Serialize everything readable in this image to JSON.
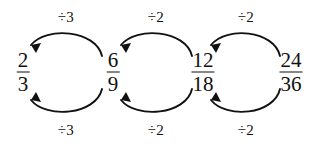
{
  "diagram": {
    "type": "fraction-reduction-chain",
    "ink_color": "#111111",
    "background_color": "#ffffff",
    "fractions": [
      {
        "id": "frac-1",
        "numerator": "2",
        "denominator": "3",
        "x": 23,
        "y": 72
      },
      {
        "id": "frac-2",
        "numerator": "6",
        "denominator": "9",
        "x": 113,
        "y": 72
      },
      {
        "id": "frac-3",
        "numerator": "12",
        "denominator": "18",
        "x": 203,
        "y": 72
      },
      {
        "id": "frac-4",
        "numerator": "24",
        "denominator": "36",
        "x": 291,
        "y": 72
      }
    ],
    "operations": [
      {
        "id": "op-top-1",
        "label": "÷3",
        "position": "top",
        "x": 66,
        "y": 17,
        "from": "frac-2",
        "to": "frac-1"
      },
      {
        "id": "op-top-2",
        "label": "÷2",
        "position": "top",
        "x": 156,
        "y": 17,
        "from": "frac-3",
        "to": "frac-2"
      },
      {
        "id": "op-top-3",
        "label": "÷2",
        "position": "top",
        "x": 246,
        "y": 17,
        "from": "frac-4",
        "to": "frac-3"
      },
      {
        "id": "op-bottom-1",
        "label": "÷3",
        "position": "bottom",
        "x": 66,
        "y": 130,
        "from": "frac-2",
        "to": "frac-1"
      },
      {
        "id": "op-bottom-2",
        "label": "÷2",
        "position": "bottom",
        "x": 156,
        "y": 130,
        "from": "frac-3",
        "to": "frac-2"
      },
      {
        "id": "op-bottom-3",
        "label": "÷2",
        "position": "bottom",
        "x": 246,
        "y": 130,
        "from": "frac-4",
        "to": "frac-3"
      }
    ],
    "arrows": [
      {
        "id": "arrow-top-1",
        "direction": "right-to-left",
        "curve": "arc-above"
      },
      {
        "id": "arrow-top-2",
        "direction": "right-to-left",
        "curve": "arc-above"
      },
      {
        "id": "arrow-top-3",
        "direction": "right-to-left",
        "curve": "arc-above"
      },
      {
        "id": "arrow-bottom-1",
        "direction": "right-to-left",
        "curve": "arc-below"
      },
      {
        "id": "arrow-bottom-2",
        "direction": "right-to-left",
        "curve": "arc-below"
      },
      {
        "id": "arrow-bottom-3",
        "direction": "right-to-left",
        "curve": "arc-below"
      }
    ]
  }
}
